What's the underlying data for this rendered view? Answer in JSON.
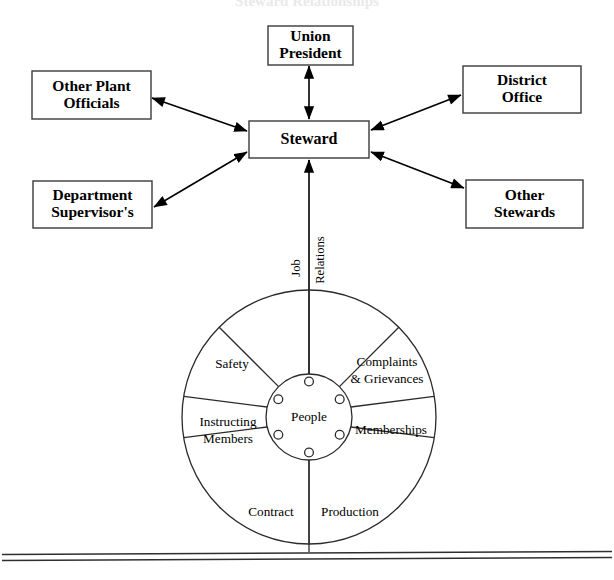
{
  "page": {
    "title_fragment": "Steward Relationships",
    "background_color": "#ffffff",
    "line_color": "#000000"
  },
  "top_network": {
    "center_node": {
      "label": "Steward"
    },
    "nodes": [
      {
        "id": "union-president",
        "label": "Union\nPresident",
        "line1": "Union",
        "line2": "President",
        "position": "top"
      },
      {
        "id": "other-plant-officials",
        "label": "Other Plant\nOfficials",
        "line1": "Other Plant",
        "line2": "Officials",
        "position": "top-left"
      },
      {
        "id": "department-supervisors",
        "label": "Department\nSupervisor's",
        "line1": "Department",
        "line2": "Supervisor's",
        "position": "bottom-left"
      },
      {
        "id": "district-office",
        "label": "District\nOffice",
        "line1": "District",
        "line2": "Office",
        "position": "top-right"
      },
      {
        "id": "other-stewards",
        "label": "Other\nStewards",
        "line1": "Other",
        "line2": "Stewards",
        "position": "bottom-right"
      }
    ],
    "connector_style": "double-headed-arrow"
  },
  "axis": {
    "label_left": "Job",
    "label_right": "Relations",
    "orientation": "vertical-rotated"
  },
  "wheel": {
    "hub_label": "People",
    "hub_dot_count": 6,
    "sectors": [
      {
        "id": "complaints-grievances",
        "line1": "Complaints",
        "line2": "& Grievances"
      },
      {
        "id": "memberships",
        "line1": "Memberships",
        "line2": ""
      },
      {
        "id": "production",
        "line1": "Production",
        "line2": ""
      },
      {
        "id": "contract",
        "line1": "Contract",
        "line2": ""
      },
      {
        "id": "instructing-members",
        "line1": "Instructing",
        "line2": "Members"
      },
      {
        "id": "safety",
        "line1": "Safety",
        "line2": ""
      }
    ]
  },
  "footer": {
    "rule_style": "double-horizontal-rule"
  }
}
